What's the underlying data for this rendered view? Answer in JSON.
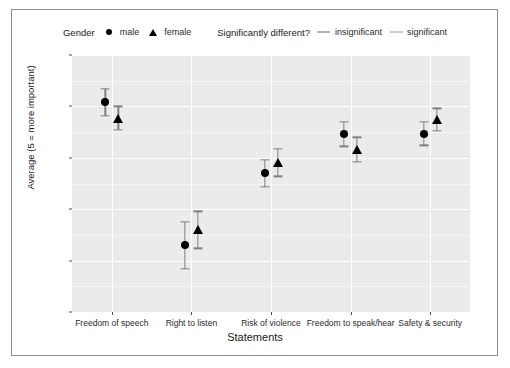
{
  "chart_data": {
    "type": "scatter",
    "title": "",
    "xlabel": "Statements",
    "ylabel": "Average (5 = more important)",
    "ylim": [
      2.5,
      5.0
    ],
    "yticks": [
      "2.5",
      "3.0",
      "3.5",
      "4.0",
      "4.5",
      "5.0"
    ],
    "ytick_values": [
      2.5,
      3.0,
      3.5,
      4.0,
      4.5,
      5.0
    ],
    "grid": true,
    "legend_position": "top",
    "categories": [
      "Freedom of speech",
      "Right to listen",
      "Risk of violence",
      "Freedom to speak/hear",
      "Safety & security"
    ],
    "series": [
      {
        "name": "male",
        "glyph": "circle",
        "values": [
          4.54,
          3.15,
          3.85,
          4.23,
          4.23
        ],
        "ci_low": [
          4.41,
          2.92,
          3.72,
          4.11,
          4.12
        ],
        "ci_high": [
          4.67,
          3.38,
          3.98,
          4.35,
          4.35
        ],
        "significance": [
          "significant",
          "insignificant",
          "insignificant",
          "significant",
          "insignificant"
        ]
      },
      {
        "name": "female",
        "glyph": "triangle",
        "values": [
          4.38,
          3.3,
          3.95,
          4.08,
          4.37
        ],
        "ci_low": [
          4.27,
          3.12,
          3.82,
          3.96,
          4.26
        ],
        "ci_high": [
          4.5,
          3.48,
          4.09,
          4.2,
          4.48
        ],
        "significance": [
          "significant",
          "insignificant",
          "insignificant",
          "significant",
          "insignificant"
        ]
      }
    ]
  },
  "legends": {
    "gender": {
      "title": "Gender",
      "keys": [
        {
          "label": "male",
          "glyph": "circle",
          "color": "#000000"
        },
        {
          "label": "female",
          "glyph": "triangle",
          "color": "#000000"
        }
      ]
    },
    "significance": {
      "title": "Significantly different?",
      "keys": [
        {
          "label": "insignificant",
          "glyph": "line",
          "color": "#b4b4b4"
        },
        {
          "label": "significant",
          "glyph": "line",
          "color": "#cccccc"
        }
      ]
    }
  },
  "colors": {
    "panel_background": "#ebebeb",
    "gridline": "#ffffff",
    "point": "#000000",
    "errorbar": "#7f7f7f",
    "frame": "#8d8d8d",
    "figure_background": "#ffffff"
  }
}
